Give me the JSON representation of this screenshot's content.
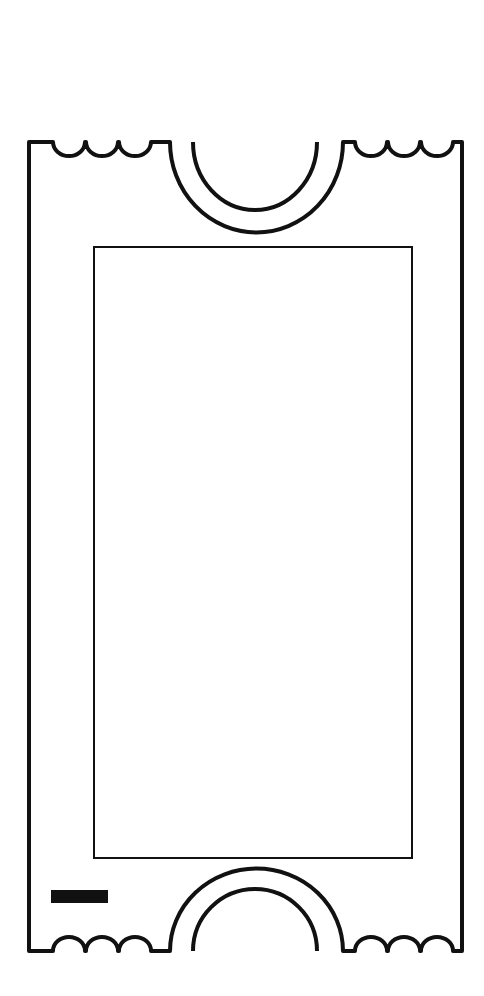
{
  "illustration": {
    "subject": "blank ticket outline",
    "stroke_color": "#111111",
    "background_color": "#ffffff",
    "fill_color": "#ffffff",
    "bar_color": "#111111",
    "scallops_per_corner": 3
  }
}
